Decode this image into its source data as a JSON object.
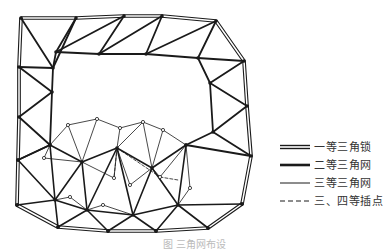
{
  "legend": {
    "items": [
      {
        "label": "一等三角锁",
        "style": "double-thick"
      },
      {
        "label": "二等三角网",
        "style": "thick"
      },
      {
        "label": "三等三角网",
        "style": "thin"
      },
      {
        "label": "三、四等插点",
        "style": "dashed"
      }
    ]
  },
  "caption": "图 三角网布设",
  "colors": {
    "line": "#1a1a1a",
    "background": "#ffffff"
  },
  "network": {
    "chain_nodes": [
      [
        21,
        18
      ],
      [
        76,
        18
      ],
      [
        124,
        16
      ],
      [
        162,
        16
      ],
      [
        216,
        21
      ],
      [
        244,
        61
      ],
      [
        247,
        106
      ],
      [
        251,
        156
      ],
      [
        242,
        204
      ],
      [
        208,
        228
      ],
      [
        156,
        231
      ],
      [
        108,
        231
      ],
      [
        58,
        227
      ],
      [
        17,
        205
      ],
      [
        18,
        160
      ],
      [
        19,
        117
      ],
      [
        19,
        67
      ],
      [
        56,
        52
      ],
      [
        99,
        54
      ],
      [
        146,
        54
      ],
      [
        198,
        58
      ],
      [
        210,
        83
      ],
      [
        213,
        132
      ],
      [
        186,
        145
      ],
      [
        50,
        145
      ],
      [
        52,
        92
      ],
      [
        53,
        68
      ]
    ],
    "chain_edges": [
      [
        0,
        1
      ],
      [
        1,
        2
      ],
      [
        2,
        3
      ],
      [
        3,
        4
      ],
      [
        4,
        5
      ],
      [
        5,
        6
      ],
      [
        6,
        7
      ],
      [
        7,
        8
      ],
      [
        8,
        9
      ],
      [
        9,
        10
      ],
      [
        10,
        11
      ],
      [
        11,
        12
      ],
      [
        12,
        13
      ],
      [
        13,
        14
      ],
      [
        14,
        15
      ],
      [
        15,
        16
      ],
      [
        16,
        0
      ],
      [
        26,
        17
      ],
      [
        17,
        18
      ],
      [
        18,
        19
      ],
      [
        19,
        20
      ],
      [
        20,
        21
      ],
      [
        21,
        22
      ],
      [
        22,
        23
      ],
      [
        0,
        26
      ],
      [
        26,
        1
      ],
      [
        1,
        17
      ],
      [
        17,
        2
      ],
      [
        2,
        18
      ],
      [
        18,
        3
      ],
      [
        3,
        19
      ],
      [
        19,
        4
      ],
      [
        4,
        20
      ],
      [
        20,
        5
      ],
      [
        5,
        21
      ],
      [
        21,
        6
      ],
      [
        6,
        22
      ],
      [
        22,
        7
      ],
      [
        7,
        23
      ],
      [
        16,
        26
      ],
      [
        16,
        25
      ],
      [
        25,
        15
      ],
      [
        15,
        24
      ],
      [
        24,
        14
      ],
      [
        26,
        25
      ],
      [
        25,
        24
      ]
    ],
    "second_nodes": [
      [
        50,
        145
      ],
      [
        82,
        162
      ],
      [
        117,
        148
      ],
      [
        152,
        168
      ],
      [
        186,
        145
      ],
      [
        55,
        200
      ],
      [
        87,
        210
      ],
      [
        133,
        215
      ],
      [
        178,
        205
      ],
      [
        208,
        228
      ],
      [
        156,
        231
      ],
      [
        108,
        231
      ],
      [
        58,
        227
      ],
      [
        17,
        205
      ],
      [
        18,
        160
      ],
      [
        242,
        204
      ]
    ],
    "second_edges": [
      [
        0,
        1
      ],
      [
        1,
        2
      ],
      [
        2,
        3
      ],
      [
        3,
        4
      ],
      [
        0,
        5
      ],
      [
        5,
        6
      ],
      [
        6,
        7
      ],
      [
        7,
        8
      ],
      [
        8,
        15
      ],
      [
        1,
        6
      ],
      [
        2,
        7
      ],
      [
        3,
        8
      ],
      [
        1,
        5
      ],
      [
        2,
        6
      ],
      [
        3,
        7
      ],
      [
        4,
        8
      ],
      [
        5,
        12
      ],
      [
        5,
        13
      ],
      [
        5,
        14
      ],
      [
        0,
        14
      ],
      [
        6,
        12
      ],
      [
        6,
        11
      ],
      [
        7,
        11
      ],
      [
        7,
        10
      ],
      [
        8,
        10
      ],
      [
        8,
        9
      ]
    ],
    "third_nodes": [
      [
        68,
        125
      ],
      [
        97,
        119
      ],
      [
        120,
        128
      ],
      [
        143,
        122
      ],
      [
        163,
        130
      ],
      [
        44,
        158
      ],
      [
        130,
        185
      ],
      [
        114,
        178
      ],
      [
        160,
        177
      ],
      [
        190,
        188
      ],
      [
        103,
        205
      ],
      [
        70,
        197
      ]
    ],
    "third_edges": [
      [
        0,
        1
      ],
      [
        1,
        2
      ],
      [
        2,
        3
      ],
      [
        3,
        4
      ],
      [
        4,
        186
      ],
      [
        0,
        50
      ],
      [
        0,
        82
      ],
      [
        1,
        82
      ],
      [
        2,
        117
      ],
      [
        3,
        117
      ],
      [
        3,
        152
      ],
      [
        4,
        152
      ],
      [
        5,
        50
      ],
      [
        5,
        82
      ],
      [
        6,
        117
      ],
      [
        6,
        152
      ],
      [
        7,
        82
      ],
      [
        7,
        117
      ],
      [
        8,
        152
      ],
      [
        8,
        186
      ],
      [
        9,
        186
      ],
      [
        9,
        178
      ],
      [
        10,
        87
      ],
      [
        10,
        133
      ],
      [
        11,
        55
      ],
      [
        11,
        87
      ]
    ],
    "dashed_edges": [
      [
        [
          117,
          148
        ],
        [
          160,
          177
        ]
      ],
      [
        [
          117,
          148
        ],
        [
          114,
          178
        ]
      ],
      [
        [
          160,
          177
        ],
        [
          178,
          180
        ]
      ]
    ]
  }
}
